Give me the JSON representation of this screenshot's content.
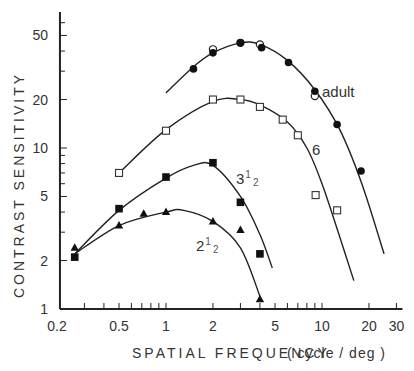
{
  "chart_data": {
    "type": "line",
    "title": "",
    "xlabel": "SPATIAL FREQUENCY (cycle / deg)",
    "ylabel": "CONTRAST SENSITIVITY",
    "xscale": "log",
    "yscale": "log",
    "xlim": [
      0.2,
      30
    ],
    "ylim": [
      1,
      70
    ],
    "x_ticks": [
      0.2,
      0.5,
      1,
      2,
      5,
      10,
      20,
      30
    ],
    "x_tick_labels": [
      "0.2",
      "0.5",
      "1",
      "2",
      "5",
      "10",
      "20",
      "30"
    ],
    "y_ticks": [
      1,
      2,
      5,
      10,
      20,
      50
    ],
    "y_tick_labels": [
      "1",
      "2",
      "5",
      "10",
      "20",
      "50"
    ],
    "grid": false,
    "legend": "inline labels",
    "series": [
      {
        "name": "adult",
        "label": "adult",
        "marker": "filled-circle",
        "points": [
          [
            1.5,
            31
          ],
          [
            2.0,
            39
          ],
          [
            3.0,
            45
          ],
          [
            4.1,
            42
          ],
          [
            6.1,
            34
          ],
          [
            9.0,
            22.5
          ],
          [
            12.5,
            14
          ],
          [
            17.8,
            7.2
          ]
        ],
        "extra_points_open_circle": [
          [
            2.0,
            41
          ],
          [
            3.0,
            45
          ],
          [
            4.0,
            44
          ],
          [
            9.0,
            21
          ]
        ],
        "curve": [
          [
            1.0,
            22
          ],
          [
            1.5,
            32
          ],
          [
            2.0,
            39
          ],
          [
            3.0,
            45
          ],
          [
            4.0,
            44
          ],
          [
            6.0,
            35
          ],
          [
            9.0,
            23
          ],
          [
            13,
            13
          ],
          [
            18,
            6
          ],
          [
            25,
            2.2
          ]
        ]
      },
      {
        "name": "6 months",
        "label": "6",
        "marker": "open-square",
        "points": [
          [
            0.5,
            7
          ],
          [
            1.0,
            12.8
          ],
          [
            2.0,
            20
          ],
          [
            3.0,
            20
          ],
          [
            4.0,
            18
          ],
          [
            5.6,
            15
          ],
          [
            7.0,
            12
          ],
          [
            9.1,
            5.1
          ],
          [
            12.5,
            4.1
          ]
        ],
        "curve": [
          [
            0.5,
            7
          ],
          [
            1.0,
            13
          ],
          [
            2.0,
            19.5
          ],
          [
            3.0,
            20
          ],
          [
            4.0,
            18.5
          ],
          [
            6.0,
            14.5
          ],
          [
            8.0,
            10
          ],
          [
            10,
            6
          ],
          [
            13,
            2.8
          ],
          [
            16,
            1.5
          ]
        ]
      },
      {
        "name": "3.5 months",
        "label_main": "3",
        "label_sup": "1",
        "label_sub": "2",
        "marker": "filled-square",
        "points": [
          [
            0.26,
            2.1
          ],
          [
            0.5,
            4.2
          ],
          [
            1.0,
            6.6
          ],
          [
            2.0,
            8.1
          ],
          [
            3.0,
            4.6
          ],
          [
            4.0,
            2.2
          ]
        ],
        "curve": [
          [
            0.26,
            2.2
          ],
          [
            0.5,
            4.1
          ],
          [
            1.0,
            6.5
          ],
          [
            1.5,
            7.8
          ],
          [
            2.0,
            7.8
          ],
          [
            3.0,
            5.0
          ],
          [
            4.0,
            2.9
          ],
          [
            4.8,
            1.8
          ]
        ]
      },
      {
        "name": "2.5 months",
        "label_main": "2",
        "label_sup": "1",
        "label_sub": "2",
        "marker": "filled-triangle",
        "points": [
          [
            0.26,
            2.4
          ],
          [
            0.5,
            3.3
          ],
          [
            0.72,
            3.9
          ],
          [
            1.0,
            4.0
          ],
          [
            2.0,
            3.5
          ],
          [
            3.0,
            3.1
          ],
          [
            4.0,
            1.15
          ]
        ],
        "curve": [
          [
            0.26,
            2.2
          ],
          [
            0.5,
            3.3
          ],
          [
            1.0,
            4.0
          ],
          [
            1.3,
            4.1
          ],
          [
            2.0,
            3.5
          ],
          [
            3.0,
            2.4
          ],
          [
            4.0,
            1.2
          ]
        ]
      }
    ]
  },
  "labels": {
    "ylabel": "CONTRAST   SENSITIVITY",
    "xlabel_main": "SPATIAL   FREQUENCY",
    "xlabel_unit": "( cycle / deg )"
  }
}
